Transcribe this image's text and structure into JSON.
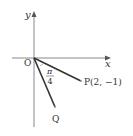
{
  "diagram": {
    "axes": {
      "x_label": "x",
      "y_label": "y",
      "origin_label": "O"
    },
    "points": {
      "P": {
        "label": "P(2, −1)"
      },
      "Q": {
        "label": "Q"
      }
    },
    "angle": {
      "numerator": "π",
      "denominator": "4"
    },
    "colors": {
      "axis": "#777777",
      "segment": "#333333",
      "text": "#333333"
    }
  }
}
